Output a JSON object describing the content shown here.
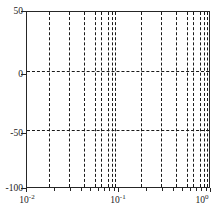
{
  "chart_data": {
    "type": "line",
    "title": "",
    "subtitle": "",
    "xlabel": "",
    "ylabel": "",
    "xscale": "log",
    "yscale": "linear",
    "xlim": [
      0.01,
      1.0
    ],
    "ylim": [
      -100,
      50
    ],
    "grid": false,
    "legend": null,
    "x_tick_labels": [
      "10⁻²",
      "10⁻¹",
      "10⁰"
    ],
    "x_tick_values": [
      0.01,
      0.1,
      1.0
    ],
    "x_tick_mantissas": [
      "10",
      "10",
      "10"
    ],
    "x_tick_exponents": [
      "-2",
      "-1",
      "0"
    ],
    "y_tick_labels": [
      "50",
      "0",
      "-50",
      "-100"
    ],
    "y_tick_values": [
      50,
      0,
      -50,
      -100
    ],
    "series": [
      {
        "name": "vertical-dashed-markers",
        "style": "dashed-vertical-lines",
        "color": "#1a1a1a",
        "x": [
          0.0175,
          0.0285,
          0.042,
          0.055,
          0.064,
          0.075,
          0.084,
          0.0915,
          0.175,
          0.285,
          0.42,
          0.55,
          0.64,
          0.75,
          0.84,
          0.915,
          0.96
        ]
      }
    ],
    "reference_lines": [
      {
        "name": "zero-db-line",
        "orientation": "horizontal",
        "value": 0,
        "style": "dashed",
        "color": "#1a1a1a"
      },
      {
        "name": "minus-fifty-db-line",
        "orientation": "horizontal",
        "value": -50,
        "style": "dashed",
        "color": "#1a1a1a"
      }
    ],
    "annotations": []
  },
  "caption": {
    "text": ""
  }
}
